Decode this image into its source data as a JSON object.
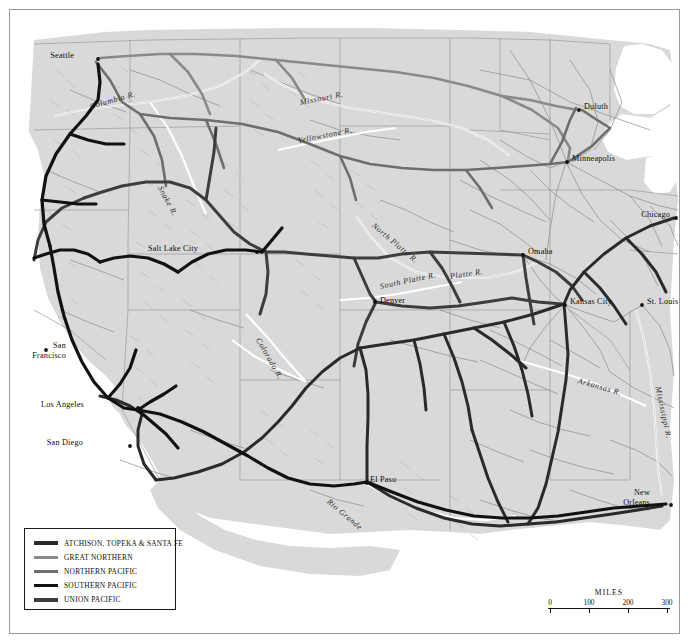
{
  "map": {
    "title": "Western Railroads",
    "land_color": "#d9d9d9",
    "water_color": "#ffffff",
    "border_color": "#9a9a9a"
  },
  "legend": {
    "name": "railroad-legend",
    "items": [
      {
        "label": "ATCHISON, TOPEKA  &  SANTA FE",
        "color": "#2a2a2a",
        "weight": 3.4
      },
      {
        "label": "GREAT NORTHERN",
        "color": "#8a8a8a",
        "weight": 3.4
      },
      {
        "label": "NORTHERN PACIFIC",
        "color": "#6e6e6e",
        "weight": 3.4
      },
      {
        "label": "SOUTHERN PACIFIC",
        "color": "#111111",
        "weight": 3.4
      },
      {
        "label": "UNION PACIFIC",
        "color": "#3d3d3d",
        "weight": 3.4
      }
    ]
  },
  "scale": {
    "title": "MILES",
    "ticks": [
      "0",
      "100",
      "200",
      "300"
    ],
    "unit": "miles"
  },
  "cities": [
    {
      "name": "Seattle",
      "label": "Seattle",
      "x": 88,
      "y": 49,
      "align": "right",
      "lx": 64,
      "ly": 45
    },
    {
      "name": "Salt Lake City",
      "label": "Salt Lake City",
      "x": 247,
      "y": 242,
      "align": "right",
      "lx": 188,
      "ly": 238
    },
    {
      "name": "San Francisco",
      "label": "San\nFrancisco",
      "x": 36,
      "y": 340,
      "align": "right",
      "lx": 8,
      "ly": 335
    },
    {
      "name": "Los Angeles",
      "label": "Los Angeles",
      "x": 128,
      "y": 398,
      "align": "right",
      "lx": 74,
      "ly": 394
    },
    {
      "name": "San Diego",
      "label": "San Diego",
      "x": 120,
      "y": 436,
      "align": "right",
      "lx": 73,
      "ly": 432
    },
    {
      "name": "El Paso",
      "label": "El Paso",
      "x": 357,
      "y": 473,
      "align": "right",
      "lx": 358,
      "ly": 469
    },
    {
      "name": "Denver",
      "label": "Denver",
      "x": 365,
      "y": 292,
      "align": "left",
      "lx": 370,
      "ly": 290
    },
    {
      "name": "Duluth",
      "label": "Duluth",
      "x": 569,
      "y": 100,
      "align": "left",
      "lx": 574,
      "ly": 96
    },
    {
      "name": "Minneapolis",
      "label": "Minneapolis",
      "x": 557,
      "y": 152,
      "align": "left",
      "lx": 562,
      "ly": 148
    },
    {
      "name": "Chicago",
      "label": "Chicago",
      "x": 668,
      "y": 208,
      "align": "right",
      "lx": 634,
      "ly": 205
    },
    {
      "name": "Omaha",
      "label": "Omaha",
      "x": 513,
      "y": 245,
      "align": "left",
      "lx": 518,
      "ly": 241
    },
    {
      "name": "Kansas City",
      "label": "Kansas City",
      "x": 555,
      "y": 295,
      "align": "left",
      "lx": 560,
      "ly": 291
    },
    {
      "name": "St. Louis",
      "label": "St. Louis",
      "x": 632,
      "y": 295,
      "align": "left",
      "lx": 637,
      "ly": 291
    },
    {
      "name": "New Orleans",
      "label": "New\nOrleans",
      "x": 661,
      "y": 495,
      "align": "right",
      "lx": 637,
      "ly": 484
    }
  ],
  "rivers": [
    {
      "name": "Columbia R.",
      "label": "Columbia R.",
      "x": 80,
      "y": 92,
      "rotate": -16
    },
    {
      "name": "Snake R.",
      "label": "Snake R.",
      "x": 150,
      "y": 172,
      "rotate": 62
    },
    {
      "name": "Missouri R.",
      "label": "Missouri R.",
      "x": 290,
      "y": 88,
      "rotate": -11
    },
    {
      "name": "Yellowstone R.",
      "label": "Yellowstone R.",
      "x": 290,
      "y": 126,
      "rotate": -11
    },
    {
      "name": "North Platte R.",
      "label": "North Platte R.",
      "x": 365,
      "y": 212,
      "rotate": 40
    },
    {
      "name": "South Platte R.",
      "label": "South Platte R.",
      "x": 372,
      "y": 272,
      "rotate": -12
    },
    {
      "name": "Platte R.",
      "label": "Platte R.",
      "x": 442,
      "y": 263,
      "rotate": -9
    },
    {
      "name": "Colorado R.",
      "label": "Colorado R.",
      "x": 250,
      "y": 325,
      "rotate": 60
    },
    {
      "name": "Rio Grande",
      "label": "Rio Grande",
      "x": 320,
      "y": 487,
      "rotate": 40
    },
    {
      "name": "Arkansas R.",
      "label": "Arkansas R.",
      "x": 572,
      "y": 368,
      "rotate": 16
    },
    {
      "name": "Mississippi R.",
      "label": "Mississippi R.",
      "x": 650,
      "y": 375,
      "rotate": 78
    }
  ]
}
